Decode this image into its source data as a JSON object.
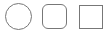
{
  "shapes": [
    {
      "kind": "circle",
      "label": "circle-shape",
      "stroke": "#777777",
      "fill": "#ffffff"
    },
    {
      "kind": "rounded-square",
      "label": "rounded-square-shape",
      "stroke": "#777777",
      "fill": "#ffffff"
    },
    {
      "kind": "square",
      "label": "square-shape",
      "stroke": "#777777",
      "fill": "#ffffff"
    }
  ]
}
